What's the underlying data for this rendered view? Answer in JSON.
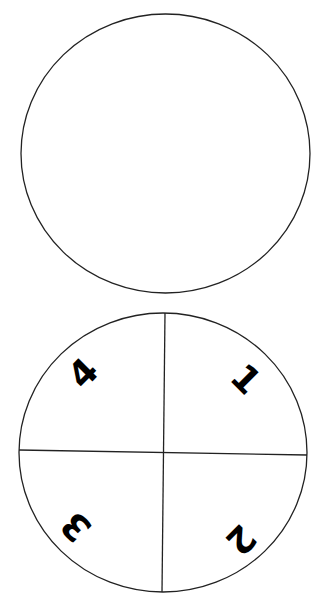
{
  "diagram": {
    "top_circle": {
      "label": "blank-circle"
    },
    "bottom_circle": {
      "label": "quadrant-circle",
      "quadrants": [
        {
          "position": "top-right",
          "number": "1"
        },
        {
          "position": "bottom-right",
          "number": "2"
        },
        {
          "position": "bottom-left",
          "number": "3"
        },
        {
          "position": "top-left",
          "number": "4"
        }
      ]
    },
    "colors": {
      "stroke": "#000000",
      "background": "#ffffff"
    }
  }
}
